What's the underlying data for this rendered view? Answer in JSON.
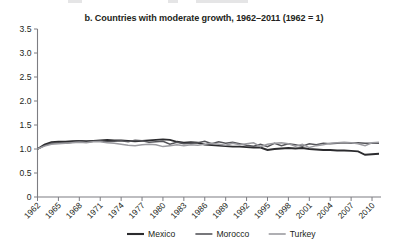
{
  "chart_data": {
    "type": "line",
    "title": "b. Countries with moderate growth, 1962–2011 (1962 = 1)",
    "xlabel": "",
    "ylabel": "",
    "ylim": [
      0,
      3.5
    ],
    "yticks": [
      "0",
      "0.5",
      "1.0",
      "1.5",
      "2.0",
      "2.5",
      "3.0",
      "3.5"
    ],
    "ytick_values": [
      0,
      0.5,
      1.0,
      1.5,
      2.0,
      2.5,
      3.0,
      3.5
    ],
    "grid": false,
    "legend_position": "bottom",
    "xlim": [
      1962,
      2011
    ],
    "xtick_labels": [
      "1962",
      "1965",
      "1968",
      "1971",
      "1974",
      "1977",
      "1980",
      "1983",
      "1986",
      "1989",
      "1992",
      "1995",
      "1998",
      "2001",
      "2004",
      "2007",
      "2010"
    ],
    "xtick_values": [
      1962,
      1965,
      1968,
      1971,
      1974,
      1977,
      1980,
      1983,
      1986,
      1989,
      1992,
      1995,
      1998,
      2001,
      2004,
      2007,
      2010
    ],
    "x": [
      1962,
      1963,
      1964,
      1965,
      1966,
      1967,
      1968,
      1969,
      1970,
      1971,
      1972,
      1973,
      1974,
      1975,
      1976,
      1977,
      1978,
      1979,
      1980,
      1981,
      1982,
      1983,
      1984,
      1985,
      1986,
      1987,
      1988,
      1989,
      1990,
      1991,
      1992,
      1993,
      1994,
      1995,
      1996,
      1997,
      1998,
      1999,
      2000,
      2001,
      2002,
      2003,
      2004,
      2005,
      2006,
      2007,
      2008,
      2009,
      2010,
      2011
    ],
    "series": [
      {
        "name": "Mexico",
        "color": "#2b2b2e",
        "width": 1.9,
        "values": [
          1.0,
          1.09,
          1.14,
          1.15,
          1.15,
          1.16,
          1.17,
          1.16,
          1.17,
          1.18,
          1.19,
          1.18,
          1.18,
          1.17,
          1.16,
          1.17,
          1.18,
          1.19,
          1.2,
          1.19,
          1.15,
          1.13,
          1.14,
          1.13,
          1.09,
          1.08,
          1.07,
          1.06,
          1.05,
          1.05,
          1.04,
          1.03,
          1.03,
          0.98,
          1.0,
          1.01,
          1.02,
          1.01,
          1.02,
          1.0,
          0.99,
          0.98,
          0.98,
          0.97,
          0.97,
          0.96,
          0.95,
          0.88,
          0.89,
          0.9
        ]
      },
      {
        "name": "Morocco",
        "color": "#55555a",
        "width": 1.5,
        "values": [
          1.0,
          1.07,
          1.12,
          1.13,
          1.12,
          1.14,
          1.16,
          1.14,
          1.16,
          1.17,
          1.15,
          1.16,
          1.17,
          1.15,
          1.18,
          1.17,
          1.14,
          1.15,
          1.16,
          1.1,
          1.14,
          1.11,
          1.12,
          1.13,
          1.16,
          1.11,
          1.15,
          1.12,
          1.14,
          1.11,
          1.08,
          1.06,
          1.1,
          1.05,
          1.12,
          1.07,
          1.11,
          1.09,
          1.06,
          1.11,
          1.09,
          1.12,
          1.11,
          1.12,
          1.13,
          1.12,
          1.13,
          1.12,
          1.12,
          1.12
        ]
      },
      {
        "name": "Turkey",
        "color": "#9b9ba0",
        "width": 1.5,
        "values": [
          1.0,
          1.06,
          1.1,
          1.11,
          1.12,
          1.13,
          1.14,
          1.13,
          1.15,
          1.15,
          1.13,
          1.12,
          1.1,
          1.08,
          1.07,
          1.09,
          1.1,
          1.09,
          1.05,
          1.07,
          1.09,
          1.07,
          1.09,
          1.08,
          1.1,
          1.12,
          1.1,
          1.08,
          1.12,
          1.09,
          1.11,
          1.13,
          1.05,
          1.1,
          1.12,
          1.13,
          1.11,
          1.06,
          1.1,
          1.03,
          1.07,
          1.09,
          1.12,
          1.13,
          1.14,
          1.13,
          1.11,
          1.07,
          1.13,
          1.14
        ]
      }
    ]
  },
  "legend": {
    "items": [
      {
        "label": "Mexico",
        "color": "#2b2b2e"
      },
      {
        "label": "Morocco",
        "color": "#55555a"
      },
      {
        "label": "Turkey",
        "color": "#9b9ba0"
      }
    ]
  }
}
